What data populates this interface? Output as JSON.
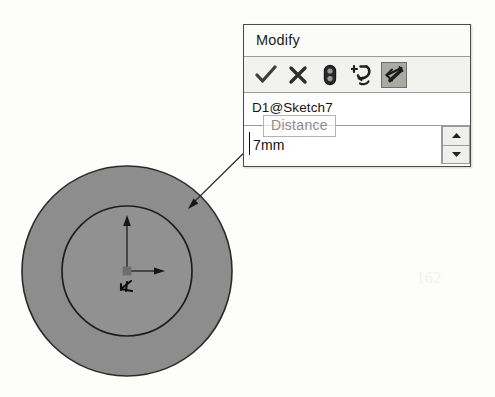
{
  "app": {
    "context": "cad-sketch-dimension-editor"
  },
  "dialog": {
    "title": "Modify",
    "toolbar": {
      "buttons": [
        {
          "label": "",
          "icon": "check-icon",
          "name": "accept-button",
          "pressed": false
        },
        {
          "label": "",
          "icon": "close-x-icon",
          "name": "cancel-button",
          "pressed": false
        },
        {
          "label": "",
          "icon": "rebuild-icon",
          "name": "rebuild-button",
          "pressed": false
        },
        {
          "label": "",
          "icon": "reverse-direction-icon",
          "name": "reverse-direction-button",
          "pressed": false
        },
        {
          "label": "",
          "icon": "mark-for-drawing-icon",
          "name": "mark-for-drawing-button",
          "pressed": true
        }
      ]
    },
    "name_field": {
      "value": "D1@Sketch7",
      "placeholder": "Dimension name"
    },
    "value_field": {
      "value": "7mm",
      "placeholder": "0mm"
    },
    "spinner": {
      "increment_label": "▲",
      "decrement_label": "▼"
    }
  },
  "tooltip": {
    "text": "Distance"
  },
  "sketch": {
    "outer_circle": {
      "cx": 127,
      "cy": 271,
      "r": 105,
      "fill": "#8f8f8f",
      "stroke": "#2b2b2b"
    },
    "inner_circle": {
      "cx": 127,
      "cy": 271,
      "r": 65,
      "fill": "#8f8f8f",
      "stroke": "#1d1d1d"
    },
    "origin": {
      "x": 127,
      "y": 271,
      "label": "origin-marker"
    },
    "leader_line": {
      "from_x": 258,
      "from_y": 140,
      "to_x": 190,
      "to_y": 207
    }
  },
  "colors": {
    "sketch_fill": "#8f8f8f",
    "sketch_stroke": "#242424",
    "dialog_border": "#4a4a4a",
    "toolbar_bg": "#f2f2f0",
    "pressed_bg": "#a9a9a6",
    "tooltip_text": "#8d8d8c"
  },
  "artifacts": {
    "smudge_text": "162"
  }
}
